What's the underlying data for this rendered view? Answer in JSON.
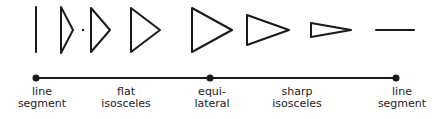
{
  "diagram": {
    "type": "spectrum",
    "stroke_color": "#1a1a1a",
    "background": "#ffffff",
    "shapes": [
      {
        "kind": "line-segment-vertical",
        "name": "vertical-line-segment"
      },
      {
        "kind": "triangle",
        "name": "very-flat-isosceles-triangle"
      },
      {
        "kind": "triangle",
        "name": "flat-isosceles-triangle-medium"
      },
      {
        "kind": "triangle",
        "name": "flat-isosceles-triangle-wide"
      },
      {
        "kind": "triangle",
        "name": "equilateral-triangle"
      },
      {
        "kind": "triangle",
        "name": "sharp-isosceles-triangle"
      },
      {
        "kind": "triangle",
        "name": "very-sharp-isosceles-triangle"
      },
      {
        "kind": "line-segment-horizontal",
        "name": "horizontal-line-segment"
      }
    ],
    "axis": {
      "markers": [
        "left-endpoint",
        "middle-point",
        "right-endpoint"
      ]
    },
    "labels": [
      {
        "line1": "line",
        "line2": "segment"
      },
      {
        "line1": "flat",
        "line2": "isosceles"
      },
      {
        "line1": "equi-",
        "line2": "lateral"
      },
      {
        "line1": "sharp",
        "line2": "isosceles"
      },
      {
        "line1": "line",
        "line2": "segment"
      }
    ]
  }
}
